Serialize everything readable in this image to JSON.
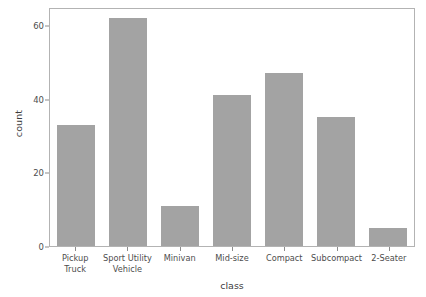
{
  "chart_data": {
    "type": "bar",
    "title": "",
    "subtitle": "",
    "xlabel": "class",
    "ylabel": "count",
    "categories": [
      "Pickup\nTruck",
      "Sport Utility\nVehicle",
      "Minivan",
      "Mid-size",
      "Compact",
      "Subcompact",
      "2-Seater"
    ],
    "values": [
      33,
      62,
      11,
      41,
      47,
      35,
      5
    ],
    "ylim": [
      0,
      65
    ],
    "yticks": [
      0,
      20,
      40,
      60
    ],
    "ytick_labels": [
      "0",
      "20",
      "40",
      "60"
    ],
    "grid": false,
    "legend": "none",
    "bar_color": "#a3a3a3",
    "panel_border_color": "#b3b3b3",
    "background": "#ffffff",
    "text_color": "#4d4d4d"
  }
}
